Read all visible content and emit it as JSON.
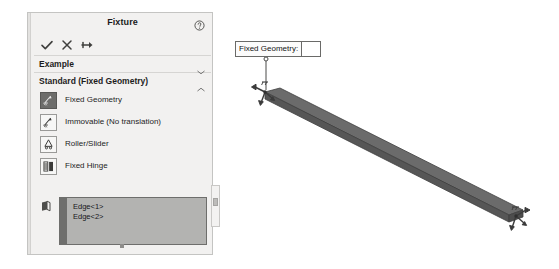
{
  "panel": {
    "title": "Fixture",
    "help_icon": "help-circle-icon",
    "toolbar": {
      "ok_label": "OK",
      "cancel_label": "Cancel",
      "pin_label": "Keep Visible"
    },
    "sections": [
      {
        "label": "Example",
        "state": "collapsed",
        "chevron": "chevron-down-icon"
      },
      {
        "label": "Standard (Fixed Geometry)",
        "state": "expanded",
        "chevron": "chevron-up-icon"
      }
    ],
    "fixture_types": [
      {
        "label": "Fixed Geometry",
        "icon": "fixed-geometry-icon",
        "selected": true
      },
      {
        "label": "Immovable (No translation)",
        "icon": "immovable-icon",
        "selected": false
      },
      {
        "label": "Roller/Slider",
        "icon": "roller-slider-icon",
        "selected": false
      },
      {
        "label": "Fixed Hinge",
        "icon": "fixed-hinge-icon",
        "selected": false
      }
    ],
    "selection": {
      "entity_icon": "face-selection-icon",
      "items": [
        "Edge<1>",
        "Edge<2>"
      ]
    }
  },
  "viewport": {
    "callout": {
      "label": "Fixed Geometry:",
      "value": ""
    },
    "model": {
      "name": "beam-solid",
      "fixture_symbols": [
        "restraint-arrow-start",
        "restraint-arrow-end"
      ]
    }
  },
  "colors": {
    "panel_bg": "#f2f1f0",
    "panel_border": "#c4c4c2",
    "selection_box_bg": "#b3b3b1",
    "beam_fill": "#595959",
    "beam_top_fill": "#6a6a6a",
    "text": "#1d1d1d"
  }
}
